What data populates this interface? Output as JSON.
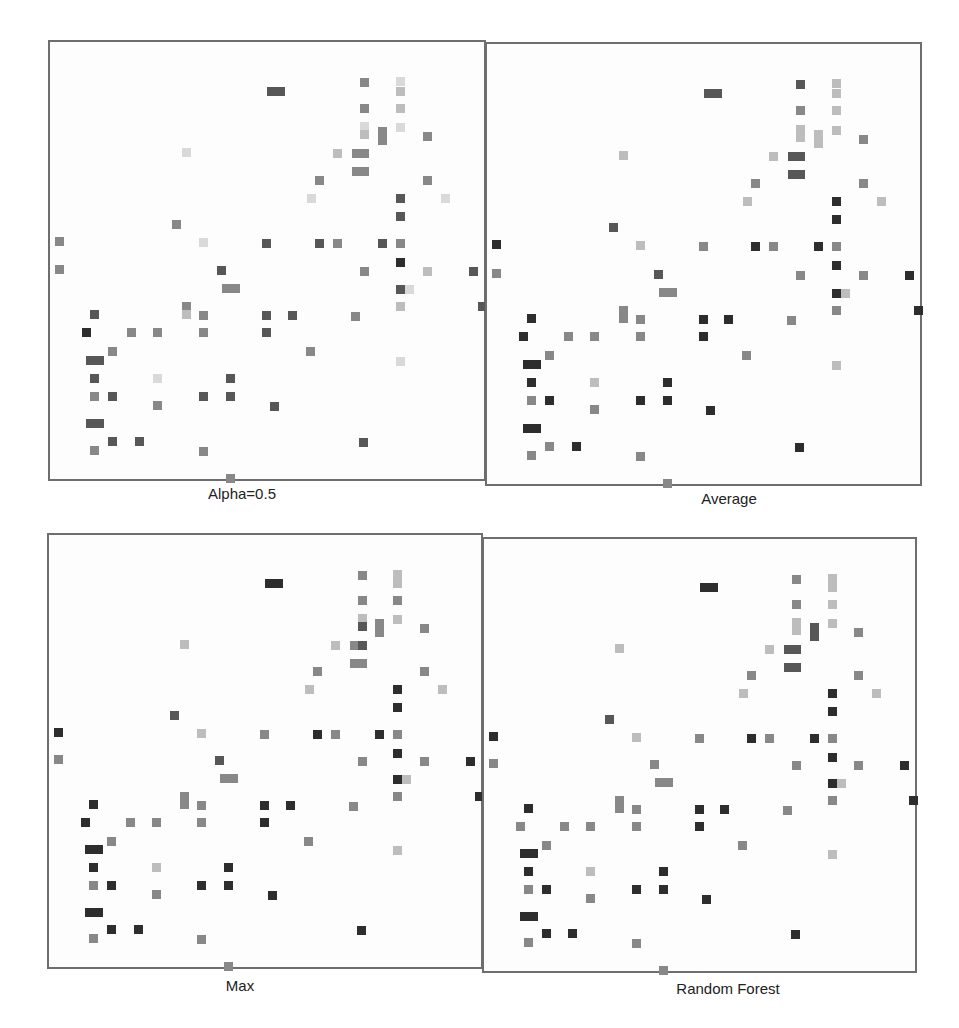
{
  "figure": {
    "panels": [
      {
        "id": "alpha",
        "title": "Alpha=0.5",
        "x": 48,
        "y": 40,
        "w": 438,
        "h": 441,
        "label_x": 142,
        "label_y": 485
      },
      {
        "id": "average",
        "title": "Average",
        "x": 485,
        "y": 42,
        "w": 437,
        "h": 444,
        "label_x": 629,
        "label_y": 490
      },
      {
        "id": "max",
        "title": "Max",
        "x": 47,
        "y": 533,
        "w": 436,
        "h": 436,
        "label_x": 140,
        "label_y": 977
      },
      {
        "id": "random-forest",
        "title": "Random Forest",
        "x": 482,
        "y": 537,
        "w": 435,
        "h": 436,
        "label_x": 628,
        "label_y": 980
      }
    ]
  },
  "chart_data": {
    "type": "heatmap",
    "title": "",
    "shade_levels": {
      "vl": "#d9d9d9",
      "l": "#bdbdbd",
      "m": "#888888",
      "d": "#575757",
      "vd": "#2d2d2d"
    },
    "cell_size": 9,
    "cells": [
      [
        312,
        38,
        9,
        9
      ],
      [
        348,
        37,
        9,
        9
      ],
      [
        348,
        47,
        9,
        9
      ],
      [
        219,
        47,
        18,
        9
      ],
      [
        312,
        64,
        9,
        9
      ],
      [
        348,
        64,
        9,
        9
      ],
      [
        312,
        82,
        9,
        9
      ],
      [
        312,
        90,
        9,
        9
      ],
      [
        330,
        87,
        9,
        18
      ],
      [
        348,
        83,
        9,
        9
      ],
      [
        375,
        92,
        9,
        9
      ],
      [
        134,
        108,
        9,
        9
      ],
      [
        285,
        109,
        9,
        9
      ],
      [
        304,
        109,
        9,
        9
      ],
      [
        312,
        109,
        9,
        9
      ],
      [
        304,
        127,
        9,
        9
      ],
      [
        312,
        127,
        9,
        9
      ],
      [
        267,
        136,
        9,
        9
      ],
      [
        375,
        136,
        9,
        9
      ],
      [
        259,
        154,
        9,
        9
      ],
      [
        348,
        154,
        9,
        9
      ],
      [
        393,
        154,
        9,
        9
      ],
      [
        348,
        172,
        9,
        9
      ],
      [
        124,
        180,
        9,
        9
      ],
      [
        7,
        197,
        9,
        9
      ],
      [
        151,
        198,
        9,
        9
      ],
      [
        214,
        199,
        9,
        9
      ],
      [
        267,
        199,
        9,
        9
      ],
      [
        285,
        199,
        9,
        9
      ],
      [
        330,
        199,
        9,
        9
      ],
      [
        348,
        199,
        9,
        9
      ],
      [
        348,
        218,
        9,
        9
      ],
      [
        7,
        225,
        9,
        9
      ],
      [
        169,
        226,
        9,
        9
      ],
      [
        312,
        227,
        9,
        9
      ],
      [
        375,
        227,
        9,
        9
      ],
      [
        421,
        227,
        9,
        9
      ],
      [
        174,
        244,
        18,
        9
      ],
      [
        348,
        245,
        9,
        9
      ],
      [
        357,
        245,
        9,
        9
      ],
      [
        134,
        262,
        9,
        9
      ],
      [
        134,
        270,
        9,
        9
      ],
      [
        348,
        262,
        9,
        9
      ],
      [
        430,
        262,
        9,
        9
      ],
      [
        42,
        270,
        9,
        9
      ],
      [
        151,
        271,
        9,
        9
      ],
      [
        214,
        271,
        9,
        9
      ],
      [
        240,
        271,
        9,
        9
      ],
      [
        303,
        272,
        9,
        9
      ],
      [
        34,
        288,
        9,
        9
      ],
      [
        79,
        288,
        9,
        9
      ],
      [
        105,
        288,
        9,
        9
      ],
      [
        151,
        288,
        9,
        9
      ],
      [
        214,
        288,
        9,
        9
      ],
      [
        60,
        307,
        9,
        9
      ],
      [
        258,
        307,
        9,
        9
      ],
      [
        38,
        316,
        18,
        9
      ],
      [
        348,
        317,
        9,
        9
      ],
      [
        42,
        334,
        9,
        9
      ],
      [
        105,
        334,
        9,
        9
      ],
      [
        178,
        334,
        9,
        9
      ],
      [
        42,
        352,
        9,
        9
      ],
      [
        60,
        352,
        9,
        9
      ],
      [
        151,
        352,
        9,
        9
      ],
      [
        178,
        352,
        9,
        9
      ],
      [
        105,
        361,
        9,
        9
      ],
      [
        222,
        362,
        9,
        9
      ],
      [
        38,
        379,
        18,
        9
      ],
      [
        60,
        397,
        9,
        9
      ],
      [
        87,
        397,
        9,
        9
      ],
      [
        311,
        398,
        9,
        9
      ],
      [
        42,
        406,
        9,
        9
      ],
      [
        151,
        407,
        9,
        9
      ],
      [
        178,
        434,
        9,
        9
      ]
    ],
    "series": [
      {
        "name": "Alpha=0.5",
        "shades": [
          "m",
          "vl",
          "l",
          "d",
          "m",
          "l",
          "vl",
          "l",
          "m",
          "vl",
          "m",
          "vl",
          "l",
          "m",
          "m",
          "m",
          "m",
          "m",
          "m",
          "vl",
          "d",
          "vl",
          "d",
          "m",
          "m",
          "vl",
          "d",
          "d",
          "m",
          "d",
          "m",
          "vd",
          "m",
          "d",
          "m",
          "l",
          "d",
          "m",
          "d",
          "vl",
          "m",
          "l",
          "l",
          "d",
          "d",
          "m",
          "d",
          "d",
          "m",
          "vd",
          "m",
          "m",
          "m",
          "d",
          "m",
          "m",
          "d",
          "vl",
          "d",
          "vl",
          "d",
          "m",
          "d",
          "d",
          "d",
          "m",
          "d",
          "d",
          "d",
          "d",
          "d",
          "m",
          "m",
          "m"
        ]
      },
      {
        "name": "Average",
        "shades": [
          "d",
          "l",
          "l",
          "d",
          "m",
          "l",
          "l",
          "l",
          "l",
          "l",
          "m",
          "l",
          "l",
          "d",
          "d",
          "d",
          "d",
          "m",
          "m",
          "l",
          "vd",
          "l",
          "vd",
          "d",
          "vd",
          "l",
          "m",
          "vd",
          "m",
          "vd",
          "m",
          "vd",
          "m",
          "d",
          "m",
          "m",
          "vd",
          "m",
          "vd",
          "l",
          "m",
          "m",
          "m",
          "vd",
          "vd",
          "m",
          "vd",
          "vd",
          "m",
          "vd",
          "m",
          "m",
          "m",
          "vd",
          "m",
          "m",
          "vd",
          "l",
          "vd",
          "l",
          "vd",
          "m",
          "vd",
          "vd",
          "vd",
          "m",
          "vd",
          "vd",
          "m",
          "vd",
          "vd",
          "m",
          "m",
          "m"
        ]
      },
      {
        "name": "Max",
        "shades": [
          "m",
          "l",
          "l",
          "vd",
          "m",
          "m",
          "l",
          "d",
          "m",
          "l",
          "m",
          "l",
          "l",
          "m",
          "d",
          "m",
          "m",
          "m",
          "m",
          "l",
          "vd",
          "l",
          "vd",
          "d",
          "vd",
          "l",
          "m",
          "vd",
          "m",
          "vd",
          "m",
          "vd",
          "m",
          "d",
          "m",
          "m",
          "vd",
          "m",
          "vd",
          "l",
          "m",
          "m",
          "m",
          "vd",
          "vd",
          "m",
          "vd",
          "vd",
          "m",
          "vd",
          "m",
          "m",
          "m",
          "vd",
          "m",
          "m",
          "vd",
          "l",
          "vd",
          "l",
          "vd",
          "m",
          "vd",
          "vd",
          "vd",
          "m",
          "vd",
          "vd",
          "vd",
          "vd",
          "vd",
          "m",
          "m",
          "m"
        ]
      },
      {
        "name": "Random Forest",
        "shades": [
          "m",
          "l",
          "l",
          "vd",
          "m",
          "l",
          "l",
          "l",
          "d",
          "l",
          "m",
          "l",
          "l",
          "d",
          "d",
          "d",
          "d",
          "m",
          "m",
          "l",
          "vd",
          "l",
          "vd",
          "d",
          "vd",
          "l",
          "m",
          "vd",
          "m",
          "vd",
          "m",
          "vd",
          "m",
          "m",
          "m",
          "m",
          "vd",
          "m",
          "vd",
          "l",
          "m",
          "m",
          "m",
          "vd",
          "vd",
          "m",
          "vd",
          "vd",
          "m",
          "m",
          "m",
          "m",
          "m",
          "vd",
          "m",
          "m",
          "vd",
          "l",
          "vd",
          "l",
          "vd",
          "m",
          "vd",
          "vd",
          "vd",
          "m",
          "vd",
          "vd",
          "vd",
          "vd",
          "vd",
          "m",
          "m",
          "m"
        ]
      }
    ],
    "legend": [],
    "xlabel": "",
    "ylabel": "",
    "grid": false
  }
}
